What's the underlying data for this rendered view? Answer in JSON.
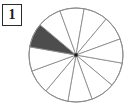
{
  "figure": {
    "label_box": {
      "number": "1"
    },
    "caption": ""
  },
  "chart_data": {
    "type": "pie",
    "title": "",
    "subtitle": "",
    "xlabel": "",
    "ylabel": "",
    "legend_position": "none",
    "grid": false,
    "total_slices": 12,
    "shaded_slices": 1,
    "unshaded_slices": 11,
    "fraction_shaded": "1/12",
    "fraction_value": 0.0833,
    "slice_angle_degrees": 30,
    "start_angle_degrees": 10,
    "categories": [
      "shaded",
      "unshaded"
    ],
    "values": [
      1,
      11
    ],
    "slices": [
      {
        "index": 1,
        "start_deg": 10,
        "end_deg": 40,
        "shaded": false
      },
      {
        "index": 2,
        "start_deg": 40,
        "end_deg": 70,
        "shaded": false
      },
      {
        "index": 3,
        "start_deg": 70,
        "end_deg": 100,
        "shaded": false
      },
      {
        "index": 4,
        "start_deg": 100,
        "end_deg": 130,
        "shaded": false
      },
      {
        "index": 5,
        "start_deg": 130,
        "end_deg": 160,
        "shaded": false
      },
      {
        "index": 6,
        "start_deg": 160,
        "end_deg": 190,
        "shaded": false
      },
      {
        "index": 7,
        "start_deg": 190,
        "end_deg": 220,
        "shaded": true
      },
      {
        "index": 8,
        "start_deg": 220,
        "end_deg": 250,
        "shaded": false
      },
      {
        "index": 9,
        "start_deg": 250,
        "end_deg": 280,
        "shaded": false
      },
      {
        "index": 10,
        "start_deg": 280,
        "end_deg": 310,
        "shaded": false
      },
      {
        "index": 11,
        "start_deg": 310,
        "end_deg": 340,
        "shaded": false
      },
      {
        "index": 12,
        "start_deg": 340,
        "end_deg": 370,
        "shaded": false
      }
    ],
    "geometry": {
      "center_x": 76,
      "center_y": 55,
      "radius": 47
    },
    "colors": {
      "shaded_fill": "#4d4d4d",
      "unshaded_fill": "#ffffff",
      "outline": "#8c8c8c",
      "center_dot": "#1a1a1a",
      "label_border": "#2b2b2b",
      "label_text": "#1a1a1a",
      "background": "#ffffff"
    }
  }
}
